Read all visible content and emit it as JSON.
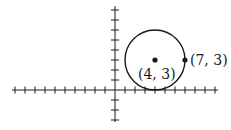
{
  "diagram": {
    "type": "coordinate-plane-circle",
    "axes": {
      "origin_px": [
        115,
        90
      ],
      "unit_px": 10,
      "x_ticks_min": -10,
      "x_ticks_max": 10,
      "y_ticks_min": -3,
      "y_ticks_max": 8
    },
    "circle": {
      "center": [
        4,
        3
      ],
      "radius": 3
    },
    "points": [
      {
        "label": "(4, 3)",
        "x": 4,
        "y": 3
      },
      {
        "label": "(7, 3)",
        "x": 7,
        "y": 3
      }
    ],
    "color": "#1a1a1a"
  }
}
